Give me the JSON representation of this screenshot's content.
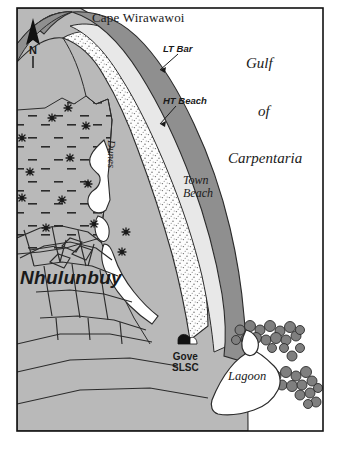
{
  "figure": {
    "kind": "thematic-coastal-map",
    "region": "Nhulunbuy / Gove Peninsula, Northern Territory",
    "frame_color": "#111111",
    "land_fill": "#b9b9b9",
    "water_fill": "#ffffff",
    "bar_fill": "#8f8f8f",
    "dune_fill": "#fdfdfd"
  },
  "labels": {
    "cape": "Cape Wirawawoi",
    "gulf": "Gulf",
    "of": "of",
    "carpentaria": "Carpentaria",
    "lt_bar": "LT Bar",
    "ht_beach": "HT Beach",
    "town_beach": "Town\nBeach",
    "dunes": "Dunes",
    "nhulunbuy": "Nhulunbuy",
    "gove_slsc": "Gove\nSLSC",
    "lagoon": "Lagoon",
    "north": "N"
  },
  "legend_symbols": {
    "north_arrow": "north-arrow-icon",
    "slsc_marker": "slsc-marker-icon",
    "mangrove": "mangrove-symbol-icon",
    "rock": "rock-cluster-icon",
    "sand_stipple": "sand-stipple-pattern"
  }
}
